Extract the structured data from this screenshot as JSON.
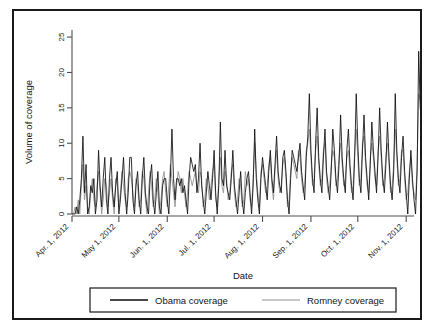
{
  "figure": {
    "background": "#ffffff",
    "frame_color": "#1a1a1a"
  },
  "chart_data": {
    "type": "line",
    "title": "",
    "subtitle": "",
    "xlabel": "Date",
    "ylabel": "Volume of coverage",
    "grid": false,
    "legend_position": "bottom-outside",
    "xlim": [
      "2012-04-01",
      "2012-11-07"
    ],
    "ylim": [
      0,
      26
    ],
    "ytick_values": [
      0,
      5,
      10,
      15,
      20,
      25
    ],
    "ytick_labels": [
      "0",
      "5",
      "10",
      "15",
      "20",
      "25"
    ],
    "xtick_dates": [
      "2012-04-01",
      "2012-05-01",
      "2012-06-01",
      "2012-07-01",
      "2012-08-01",
      "2012-09-01",
      "2012-10-01",
      "2012-11-01"
    ],
    "xtick_labels": [
      "Apr. 1, 2012",
      "May 1, 2012",
      "Jun. 1, 2012",
      "Jul. 1, 2012",
      "Aug. 1, 2012",
      "Sep. 1, 2012",
      "Oct. 1, 2012",
      "Nov. 1, 2012"
    ],
    "xtick_label_rotation": 45,
    "ytick_label_rotation": 90,
    "x_start_date": "2012-04-01",
    "x_step_days": 1,
    "colors": {
      "obama": "#0d0d0d",
      "romney": "#8f8f8f"
    },
    "series": [
      {
        "name": "Obama coverage",
        "color": "#0d0d0d",
        "values": [
          0,
          0,
          0,
          1,
          0,
          2,
          5,
          11,
          3,
          7,
          0,
          1,
          4,
          3,
          5,
          0,
          2,
          9,
          4,
          1,
          5,
          8,
          2,
          0,
          5,
          8,
          3,
          1,
          4,
          6,
          0,
          2,
          5,
          8,
          3,
          0,
          3,
          8,
          8,
          2,
          0,
          4,
          6,
          2,
          0,
          5,
          8,
          3,
          1,
          0,
          5,
          7,
          2,
          0,
          3,
          6,
          1,
          0,
          4,
          5,
          5,
          2,
          0,
          5,
          12,
          5,
          2,
          5,
          5,
          4,
          5,
          3,
          4,
          2,
          0,
          5,
          8,
          7,
          6,
          7,
          3,
          5,
          10,
          4,
          2,
          0,
          3,
          6,
          4,
          2,
          5,
          9,
          3,
          0,
          4,
          13,
          5,
          4,
          9,
          4,
          3,
          2,
          5,
          9,
          4,
          2,
          0,
          3,
          6,
          2,
          0,
          3,
          5,
          6,
          3,
          0,
          4,
          12,
          5,
          2,
          0,
          5,
          8,
          6,
          4,
          2,
          6,
          9,
          5,
          3,
          7,
          11,
          6,
          4,
          3,
          8,
          9,
          6,
          2,
          0,
          5,
          9,
          8,
          7,
          6,
          8,
          10,
          6,
          4,
          2,
          8,
          11,
          17,
          9,
          5,
          3,
          10,
          15,
          8,
          5,
          3,
          8,
          12,
          6,
          4,
          2,
          6,
          12,
          9,
          5,
          3,
          7,
          14,
          8,
          5,
          3,
          9,
          12,
          7,
          4,
          2,
          8,
          17,
          10,
          5,
          3,
          9,
          14,
          8,
          5,
          2,
          7,
          13,
          9,
          6,
          3,
          8,
          15,
          9,
          5,
          3,
          7,
          13,
          8,
          4,
          2,
          6,
          17,
          9,
          5,
          3,
          8,
          11,
          6,
          3,
          0,
          5,
          9,
          5,
          2,
          0,
          6,
          23,
          15,
          12
        ]
      },
      {
        "name": "Romney coverage",
        "color": "#8f8f8f",
        "values": [
          0,
          0,
          1,
          0,
          2,
          0,
          4,
          7,
          2,
          4,
          1,
          0,
          3,
          5,
          2,
          1,
          4,
          6,
          3,
          0,
          2,
          5,
          4,
          1,
          3,
          5,
          2,
          0,
          5,
          4,
          1,
          3,
          6,
          4,
          2,
          1,
          5,
          6,
          5,
          3,
          1,
          5,
          4,
          1,
          2,
          6,
          5,
          2,
          0,
          3,
          6,
          4,
          1,
          2,
          5,
          3,
          0,
          2,
          5,
          6,
          3,
          1,
          4,
          7,
          5,
          3,
          1,
          4,
          6,
          5,
          3,
          5,
          3,
          1,
          3,
          6,
          5,
          4,
          5,
          6,
          4,
          3,
          6,
          5,
          1,
          2,
          5,
          4,
          2,
          4,
          6,
          7,
          2,
          1,
          5,
          8,
          4,
          3,
          6,
          5,
          2,
          3,
          6,
          7,
          3,
          1,
          2,
          5,
          4,
          1,
          2,
          6,
          4,
          5,
          2,
          1,
          5,
          10,
          6,
          3,
          1,
          6,
          7,
          5,
          3,
          4,
          7,
          8,
          4,
          2,
          6,
          9,
          5,
          3,
          4,
          7,
          8,
          5,
          1,
          2,
          6,
          8,
          7,
          6,
          5,
          9,
          8,
          5,
          3,
          4,
          9,
          10,
          12,
          8,
          4,
          5,
          9,
          11,
          7,
          4,
          5,
          9,
          10,
          5,
          3,
          4,
          7,
          9,
          8,
          4,
          5,
          8,
          10,
          7,
          4,
          5,
          8,
          9,
          6,
          3,
          4,
          9,
          12,
          8,
          4,
          5,
          10,
          11,
          7,
          4,
          3,
          8,
          10,
          8,
          5,
          4,
          9,
          11,
          8,
          4,
          5,
          8,
          10,
          7,
          3,
          4,
          7,
          12,
          8,
          4,
          5,
          9,
          9,
          5,
          2,
          3,
          6,
          8,
          4,
          3,
          2,
          7,
          17,
          16,
          12
        ]
      }
    ]
  },
  "legend": {
    "items": [
      {
        "label": "Obama coverage",
        "color": "#0d0d0d"
      },
      {
        "label": "Romney coverage",
        "color": "#8f8f8f"
      }
    ]
  }
}
